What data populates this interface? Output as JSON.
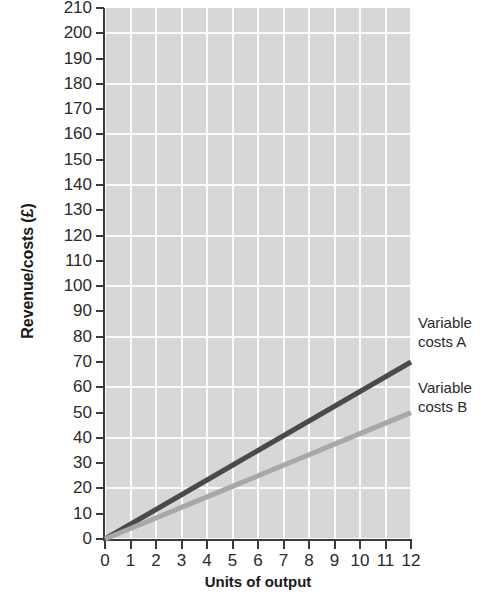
{
  "chart_data": {
    "type": "line",
    "title": "",
    "subtitle": "",
    "xlabel": "Units of output",
    "ylabel": "Revenue/costs (£)",
    "xlim": [
      0,
      12
    ],
    "ylim": [
      0,
      210
    ],
    "x_tick_step": 1,
    "y_tick_step": 10,
    "grid": true,
    "grid_x_step": 1,
    "grid_y_step": 20,
    "legend_position": "right-inline-annotations",
    "x": [
      0,
      1,
      2,
      3,
      4,
      5,
      6,
      7,
      8,
      9,
      10,
      11,
      12
    ],
    "x_tick_labels": [
      "0",
      "1",
      "2",
      "3",
      "4",
      "5",
      "6",
      "7",
      "8",
      "9",
      "10",
      "11",
      "12"
    ],
    "y_tick_labels": [
      "0",
      "10",
      "20",
      "30",
      "40",
      "50",
      "60",
      "70",
      "80",
      "90",
      "100",
      "110",
      "120",
      "130",
      "140",
      "150",
      "160",
      "170",
      "180",
      "190",
      "200",
      "210"
    ],
    "series": [
      {
        "name": "Variable costs A",
        "color": "#4a4a4a",
        "values": [
          0,
          5.83,
          11.67,
          17.5,
          23.33,
          29.17,
          35,
          40.83,
          46.67,
          52.5,
          58.33,
          64.17,
          70
        ],
        "endpoint_value": 70,
        "annotation": "Variable costs A"
      },
      {
        "name": "Variable costs B",
        "color": "#a8a8a8",
        "values": [
          0,
          4.17,
          8.33,
          12.5,
          16.67,
          20.83,
          25,
          29.17,
          33.33,
          37.5,
          41.67,
          45.83,
          50
        ],
        "endpoint_value": 50,
        "annotation": "Variable costs B"
      }
    ]
  },
  "annotations": {
    "series_a_line1": "Variable",
    "series_a_line2": "costs A",
    "series_b_line1": "Variable",
    "series_b_line2": "costs B"
  },
  "colors": {
    "plot_background": "#d7d7d7",
    "gridline": "#fbfbfb",
    "axis": "#3b3b3b",
    "series_a": "#4a4a4a",
    "series_b": "#a8a8a8",
    "page_background": "#ffffff",
    "text": "#2b2b2b"
  }
}
